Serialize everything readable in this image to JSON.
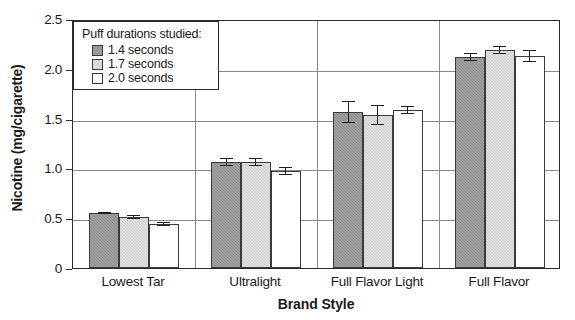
{
  "chart_data": {
    "type": "bar",
    "title": "",
    "xlabel": "Brand Style",
    "ylabel": "Nicotine (mg/cigarette)",
    "categories": [
      "Lowest Tar",
      "Ultralight",
      "Full Flavor Light",
      "Full Flavor"
    ],
    "ylim": [
      0,
      2.5
    ],
    "yticks": [
      0,
      0.5,
      1.0,
      1.5,
      2.0,
      2.5
    ],
    "ytick_labels": [
      "0",
      "0.5",
      "1.0",
      "1.5",
      "2.0",
      "2.5"
    ],
    "grid": true,
    "legend_position": "top-left",
    "legend_title": "Puff durations studied:",
    "series": [
      {
        "name": "1.4 seconds",
        "color": "#8d8d8d",
        "values": [
          0.55,
          1.06,
          1.57,
          2.12
        ],
        "errors": [
          0.01,
          0.04,
          0.11,
          0.04
        ]
      },
      {
        "name": "1.7 seconds",
        "color": "#cfcfcf",
        "values": [
          0.51,
          1.06,
          1.54,
          2.19
        ],
        "errors": [
          0.02,
          0.04,
          0.1,
          0.04
        ]
      },
      {
        "name": "2.0 seconds",
        "color": "#ffffff",
        "values": [
          0.44,
          0.97,
          1.59,
          2.13
        ],
        "errors": [
          0.02,
          0.04,
          0.04,
          0.06
        ]
      }
    ]
  },
  "axes": {
    "ylabel": "Nicotine (mg/cigarette)",
    "xlabel": "Brand Style"
  },
  "legend": {
    "title": "Puff durations studied:",
    "items": [
      {
        "label": "1.4 seconds"
      },
      {
        "label": "1.7 seconds"
      },
      {
        "label": "2.0 seconds"
      }
    ]
  }
}
